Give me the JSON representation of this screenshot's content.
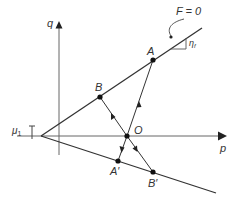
{
  "diagram": {
    "title": "",
    "axes": {
      "horizontal": {
        "label": "p"
      },
      "vertical": {
        "label": "q"
      }
    },
    "curve_label": "F = 0",
    "slope_label": "η",
    "slope_subscript": "f",
    "offset_label": "μ",
    "offset_subscript": "1",
    "points": [
      {
        "id": "A",
        "label": "A"
      },
      {
        "id": "B",
        "label": "B"
      },
      {
        "id": "O",
        "label": "O"
      },
      {
        "id": "A_prime",
        "label": "A′"
      },
      {
        "id": "B_prime",
        "label": "B′"
      }
    ],
    "colors": {
      "line": "#333333",
      "axis": "#555555",
      "point": "#111111"
    }
  }
}
